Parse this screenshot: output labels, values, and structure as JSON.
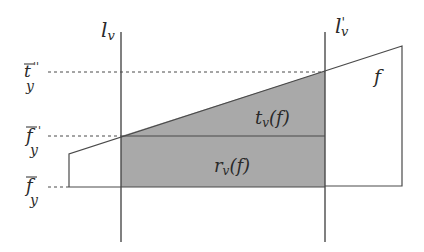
{
  "diagram": {
    "colors": {
      "line": "#4a4a4a",
      "fill": "#a9a9a9",
      "background": "#ffffff",
      "text": "#2a2a2a"
    },
    "verticals": {
      "left": {
        "label_main": "l",
        "label_sub": "v",
        "x": 121
      },
      "right": {
        "label_main": "l",
        "label_prime": "'",
        "label_sub": "v",
        "x": 325
      }
    },
    "levels": {
      "t_bar_double_prime_y": {
        "main": "t",
        "sup": "''",
        "sub": "y",
        "y": 72
      },
      "f_bar_prime_y": {
        "main": "f",
        "sup": "'",
        "sub": "y",
        "y": 136
      },
      "f_bar_y": {
        "main": "f",
        "sub": "y",
        "y": 187
      }
    },
    "regions": {
      "triangle": {
        "label_main": "t",
        "label_sub": "v",
        "label_arg": "(f)"
      },
      "rectangle": {
        "label_main": "r",
        "label_sub": "v",
        "label_arg": "(f)"
      }
    },
    "function_label": "f"
  }
}
